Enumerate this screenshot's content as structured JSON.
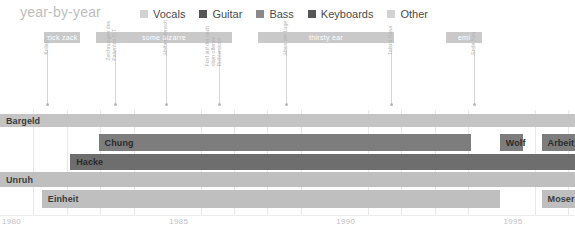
{
  "header": {
    "title": "year-by-year"
  },
  "legend": {
    "items": [
      {
        "label": "Vocals",
        "color": "#d2d2d2"
      },
      {
        "label": "Guitar",
        "color": "#555555"
      },
      {
        "label": "Bass",
        "color": "#8a8a8a"
      },
      {
        "label": "Keyboards",
        "color": "#555555"
      },
      {
        "label": "Other",
        "color": "#d2d2d2"
      }
    ]
  },
  "eras": [
    {
      "label": "zick zack",
      "start": 1980.95,
      "end": 1983.1,
      "color": "#c9c9c9"
    },
    {
      "label": "some bizarre",
      "start": 1983.85,
      "end": 1992.0,
      "color": "#c9c9c9"
    },
    {
      "label": "thirsty ear",
      "start": 1993.5,
      "end": 2001.6,
      "color": "#c9c9c9"
    },
    {
      "label": "emi",
      "start": 2012.8,
      "end": 2015.0,
      "color": "#c9c9c9"
    }
  ],
  "releases": [
    {
      "label": "Kollaps",
      "year": 1981.7
    },
    {
      "label": "Zeichnungen des Patienten O.T.",
      "year": 1985.8
    },
    {
      "label": "Halber Mensch",
      "year": 1989.3
    },
    {
      "label": "Fünf auf der nach oben offenen Richterskala",
      "year": 1993.1
    },
    {
      "label": "Haus der Lüge",
      "year": 1997.1
    },
    {
      "label": "Tabula Rasa",
      "year": 2007.4
    },
    {
      "label": "Ende Neu",
      "year": 2013.3
    }
  ],
  "axis": {
    "min": 1980,
    "max": 1997.2,
    "ticks": [
      1980,
      1985,
      1990,
      1995
    ]
  },
  "lanes": [
    {
      "name": "bargeld",
      "color": "#c4c4c4",
      "segments": [
        {
          "label": "Bargeld",
          "start": 1980.0,
          "end": 1997.2
        }
      ]
    },
    {
      "name": "chung",
      "color": "#7d7d7d",
      "segments": [
        {
          "label": "Chung",
          "start": 1982.95,
          "end": 1994.1
        },
        {
          "label": "Wolf",
          "start": 1994.95,
          "end": 1995.65
        },
        {
          "label": "Arbeit",
          "start": 1996.2,
          "end": 1997.2
        }
      ]
    },
    {
      "name": "hacke",
      "color": "#6e6e6e",
      "segments": [
        {
          "label": "Hacke",
          "start": 1982.1,
          "end": 1997.2
        }
      ]
    },
    {
      "name": "unruh",
      "color": "#bfbfbf",
      "segments": [
        {
          "label": "Unruh",
          "start": 1980.0,
          "end": 1997.2
        }
      ]
    },
    {
      "name": "einheit",
      "color": "#bfbfbf",
      "segments": [
        {
          "label": "Einheit",
          "start": 1981.25,
          "end": 1994.95
        },
        {
          "label": "Moser",
          "start": 1996.2,
          "end": 1997.2
        }
      ]
    }
  ],
  "chart_data": {
    "type": "bar",
    "title": "year-by-year",
    "xlabel": "",
    "ylabel": "",
    "xlim": [
      1980,
      1997.2
    ],
    "grid": true,
    "legend_position": "top",
    "categories": [
      "Bargeld",
      "Chung",
      "Hacke",
      "Unruh",
      "Einheit"
    ],
    "series": [
      {
        "name": "Bargeld",
        "role": "Vocals",
        "intervals": [
          [
            1980.0,
            1997.2
          ]
        ]
      },
      {
        "name": "Chung",
        "role": "Guitar",
        "intervals": [
          [
            1982.95,
            1994.1
          ]
        ]
      },
      {
        "name": "Wolf",
        "role": "Guitar",
        "intervals": [
          [
            1994.95,
            1995.65
          ]
        ]
      },
      {
        "name": "Arbeit",
        "role": "Guitar",
        "intervals": [
          [
            1996.2,
            1997.2
          ]
        ]
      },
      {
        "name": "Hacke",
        "role": "Bass",
        "intervals": [
          [
            1982.1,
            1997.2
          ]
        ]
      },
      {
        "name": "Unruh",
        "role": "Other",
        "intervals": [
          [
            1980.0,
            1997.2
          ]
        ]
      },
      {
        "name": "Einheit",
        "role": "Keyboards",
        "intervals": [
          [
            1981.25,
            1994.95
          ]
        ]
      },
      {
        "name": "Moser",
        "role": "Other",
        "intervals": [
          [
            1996.2,
            1997.2
          ]
        ]
      }
    ],
    "annotations": [
      {
        "kind": "era",
        "label": "zick zack",
        "range": [
          1980.95,
          1983.1
        ]
      },
      {
        "kind": "era",
        "label": "some bizarre",
        "range": [
          1983.85,
          1992.0
        ]
      },
      {
        "kind": "era",
        "label": "thirsty ear",
        "range": [
          1993.5,
          2001.6
        ]
      },
      {
        "kind": "era",
        "label": "emi",
        "range": [
          2012.8,
          2015.0
        ]
      },
      {
        "kind": "release",
        "label": "Kollaps",
        "at": 1981.7
      },
      {
        "kind": "release",
        "label": "Zeichnungen des Patienten O.T.",
        "at": 1985.8
      },
      {
        "kind": "release",
        "label": "Halber Mensch",
        "at": 1989.3
      },
      {
        "kind": "release",
        "label": "Fünf auf der nach oben offenen Richterskala",
        "at": 1993.1
      },
      {
        "kind": "release",
        "label": "Haus der Lüge",
        "at": 1997.1
      },
      {
        "kind": "release",
        "label": "Tabula Rasa",
        "at": 2007.4
      },
      {
        "kind": "release",
        "label": "Ende Neu",
        "at": 2013.3
      }
    ],
    "xticks": [
      1980,
      1985,
      1990,
      1995
    ]
  }
}
